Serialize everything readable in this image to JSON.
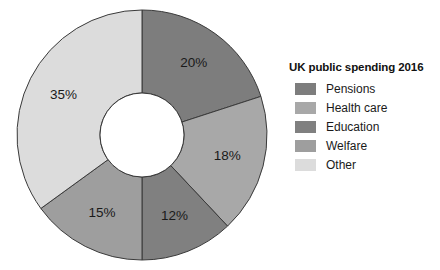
{
  "chart_data": {
    "type": "pie",
    "variant": "donut",
    "title": "UK public spending 2016",
    "xlabel": "",
    "ylabel": "",
    "legend_position": "right",
    "grid": false,
    "start_angle_deg": 0,
    "direction": "clockwise",
    "units": "%",
    "categories": [
      "Pensions",
      "Health care",
      "Education",
      "Welfare",
      "Other"
    ],
    "values": [
      20,
      18,
      12,
      15,
      35
    ],
    "data_labels": [
      "20%",
      "18%",
      "12%",
      "15%",
      "35%"
    ],
    "colors": [
      "#7d7d7d",
      "#a8a8a8",
      "#808080",
      "#9e9e9e",
      "#dcdcdc"
    ],
    "slices": [
      {
        "label": "Pensions",
        "value": 20,
        "data_label": "20%",
        "color": "#7d7d7d"
      },
      {
        "label": "Health care",
        "value": 18,
        "data_label": "18%",
        "color": "#a8a8a8"
      },
      {
        "label": "Education",
        "value": 12,
        "data_label": "12%",
        "color": "#808080"
      },
      {
        "label": "Welfare",
        "value": 15,
        "data_label": "15%",
        "color": "#9e9e9e"
      },
      {
        "label": "Other",
        "value": 35,
        "data_label": "35%",
        "color": "#dcdcdc"
      }
    ]
  },
  "legend": {
    "title": "UK public spending 2016",
    "items": [
      {
        "label": "Pensions",
        "color": "#7d7d7d"
      },
      {
        "label": "Health care",
        "color": "#a8a8a8"
      },
      {
        "label": "Education",
        "color": "#808080"
      },
      {
        "label": "Welfare",
        "color": "#9e9e9e"
      },
      {
        "label": "Other",
        "color": "#dcdcdc"
      }
    ]
  },
  "geometry": {
    "cx": 142,
    "cy": 135,
    "outer_radius": 125,
    "inner_radius": 42,
    "label_radius": 88,
    "stroke": "#3a3a3a",
    "stroke_width": 1
  }
}
